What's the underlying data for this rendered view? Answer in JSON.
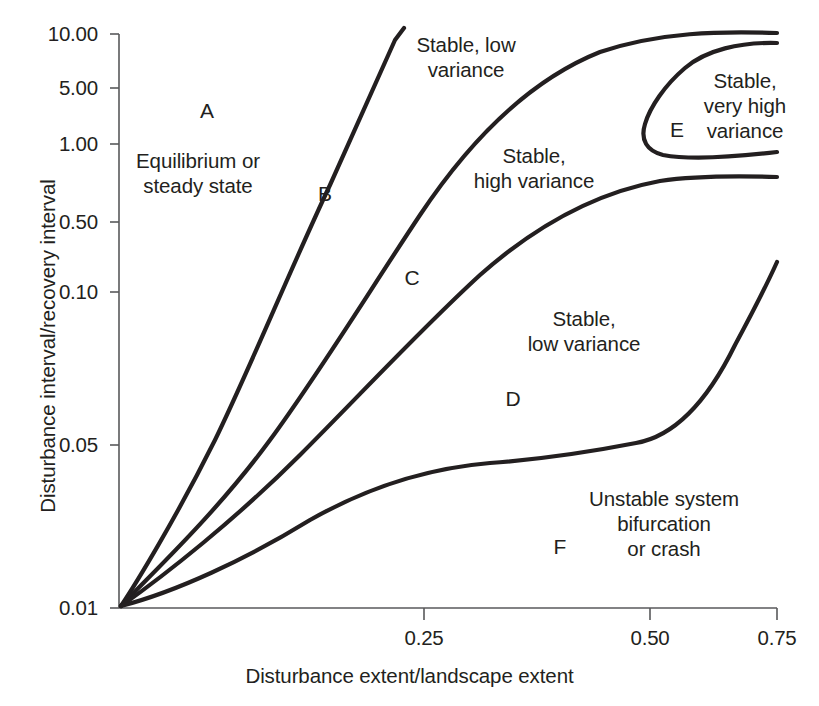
{
  "figure": {
    "title": "",
    "background": "#ffffff",
    "line_color": "#231f20",
    "axis_color": "#58595b"
  },
  "axes": {
    "x_title": "Disturbance extent/landscape extent",
    "y_title": "Disturbance interval/recovery interval",
    "x_ticks": [
      {
        "label": "0.25",
        "value": 0.25,
        "px": 424
      },
      {
        "label": "0.50",
        "value": 0.5,
        "px": 650
      },
      {
        "label": "0.75",
        "value": 0.75,
        "px": 777
      }
    ],
    "y_ticks": [
      {
        "label": "10.00",
        "value": 10.0,
        "px": 34
      },
      {
        "label": "5.00",
        "value": 5.0,
        "px": 88
      },
      {
        "label": "1.00",
        "value": 1.0,
        "px": 144
      },
      {
        "label": "0.50",
        "value": 0.5,
        "px": 222
      },
      {
        "label": "0.10",
        "value": 0.1,
        "px": 292
      },
      {
        "label": "0.05",
        "value": 0.05,
        "px": 445
      },
      {
        "label": "0.01",
        "value": 0.01,
        "px": 608
      }
    ]
  },
  "regions": [
    {
      "id": "A",
      "letter": "A",
      "letter_x": 207,
      "letter_y": 111,
      "caption": "Equilibrium or\nsteady state",
      "caption_x": 198,
      "caption_y": 173
    },
    {
      "id": "B",
      "letter": "B",
      "letter_x": 325,
      "letter_y": 194,
      "caption": "",
      "caption_x": 0,
      "caption_y": 0
    },
    {
      "id": "C",
      "letter": "C",
      "letter_x": 412,
      "letter_y": 278,
      "caption": "Stable, low\nvariance",
      "caption_x": 466,
      "caption_y": 57
    },
    {
      "id": "C2",
      "letter": "",
      "letter_x": 0,
      "letter_y": 0,
      "caption": "Stable,\nhigh variance",
      "caption_x": 534,
      "caption_y": 168
    },
    {
      "id": "D",
      "letter": "D",
      "letter_x": 513,
      "letter_y": 399,
      "caption": "Stable,\nlow variance",
      "caption_x": 584,
      "caption_y": 331
    },
    {
      "id": "E",
      "letter": "E",
      "letter_x": 677,
      "letter_y": 130,
      "caption": "Stable,\nvery high\nvariance",
      "caption_x": 745,
      "caption_y": 105
    },
    {
      "id": "F",
      "letter": "F",
      "letter_x": 560,
      "letter_y": 547,
      "caption": "Unstable system\nbifurcation\nor crash",
      "caption_x": 664,
      "caption_y": 523
    }
  ],
  "chart_data": {
    "type": "line",
    "title": "",
    "xlabel": "Disturbance extent/landscape extent",
    "ylabel": "Disturbance interval/recovery interval",
    "xlim": [
      0,
      0.75
    ],
    "ylim": [
      0.01,
      10.0
    ],
    "yscale": "log",
    "grid": false,
    "legend": null,
    "xtick_labels": [
      "0.25",
      "0.50",
      "0.75"
    ],
    "ytick_labels": [
      "10.00",
      "5.00",
      "1.00",
      "0.50",
      "0.10",
      "0.05",
      "0.01"
    ],
    "annotations": [
      "A",
      "B",
      "C",
      "D",
      "E",
      "F",
      "Equilibrium or steady state",
      "Stable, low variance",
      "Stable, high variance",
      "Stable, low variance",
      "Stable, very high variance",
      "Unstable system bifurcation or crash"
    ],
    "series": [
      {
        "name": "boundary-A-B",
        "comment": "separates region A (equilibrium) from region B",
        "x": [
          0.0,
          0.03,
          0.07,
          0.11,
          0.15,
          0.19,
          0.215,
          0.233
        ],
        "y": [
          0.01,
          0.05,
          0.28,
          1.0,
          2.4,
          5.2,
          8.3,
          10.0
        ]
      },
      {
        "name": "boundary-B-C",
        "comment": "separates region B from region C, saturates at the top of the axis",
        "x": [
          0.0,
          0.05,
          0.11,
          0.18,
          0.26,
          0.35,
          0.45,
          0.55,
          0.66,
          0.75
        ],
        "y": [
          0.01,
          0.035,
          0.17,
          0.7,
          2.0,
          4.2,
          6.4,
          8.1,
          9.4,
          10.0
        ]
      },
      {
        "name": "boundary-C-D",
        "comment": "separates region C (stable, high variance) from region D, plateaus near 0.8",
        "x": [
          0.0,
          0.06,
          0.13,
          0.21,
          0.3,
          0.39,
          0.47,
          0.55,
          0.64,
          0.75
        ],
        "y": [
          0.01,
          0.022,
          0.05,
          0.1,
          0.2,
          0.36,
          0.55,
          0.72,
          0.8,
          0.8
        ]
      },
      {
        "name": "boundary-D-F",
        "comment": "separates region D (stable, low variance) from region F (unstable), plateaus then rises sharply",
        "x": [
          0.0,
          0.06,
          0.13,
          0.21,
          0.3,
          0.39,
          0.47,
          0.55,
          0.63,
          0.7,
          0.75
        ],
        "y": [
          0.01,
          0.015,
          0.021,
          0.028,
          0.034,
          0.037,
          0.04,
          0.048,
          0.07,
          0.12,
          0.22
        ]
      },
      {
        "name": "region-E-lobe",
        "comment": "closed lobe opening to the right edge enclosing region E (stable, very high variance)",
        "x": [
          0.75,
          0.63,
          0.545,
          0.505,
          0.5,
          0.52,
          0.6,
          0.72,
          0.75
        ],
        "y": [
          8.6,
          8.4,
          5.0,
          2.2,
          1.35,
          1.03,
          0.93,
          0.93,
          0.95
        ]
      }
    ]
  }
}
